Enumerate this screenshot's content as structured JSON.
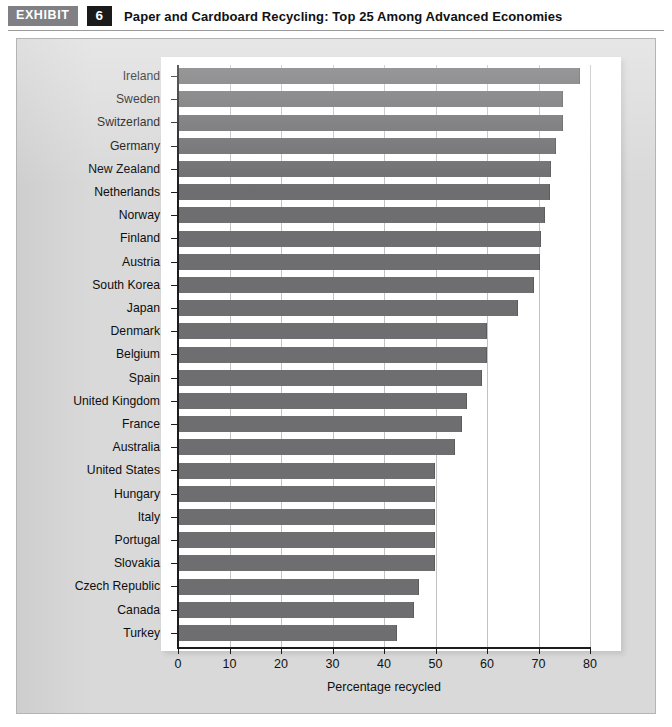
{
  "header": {
    "exhibit_tag": "EXHIBIT",
    "exhibit_number": "6",
    "title": "Paper and Cardboard Recycling: Top 25 Among Advanced Economies"
  },
  "chart_data": {
    "type": "bar",
    "orientation": "horizontal",
    "title": "Paper and Cardboard Recycling: Top 25 Among Advanced Economies",
    "xlabel": "Percentage recycled",
    "ylabel": "",
    "xlim": [
      0,
      80
    ],
    "xticks": [
      0,
      10,
      20,
      30,
      40,
      50,
      60,
      70,
      80
    ],
    "xtick_labels": [
      "0",
      "10",
      "20",
      "30",
      "40",
      "50",
      "60",
      "70",
      "80"
    ],
    "grid": "vertical",
    "legend": "none",
    "bar_color": "#6e6e70",
    "plot_background": "#ffffff",
    "panel_background": "#d9d9d9",
    "categories": [
      "Ireland",
      "Sweden",
      "Switzerland",
      "Germany",
      "New Zealand",
      "Netherlands",
      "Norway",
      "Finland",
      "Austria",
      "South Korea",
      "Japan",
      "Denmark",
      "Belgium",
      "Spain",
      "United Kingdom",
      "France",
      "Australia",
      "United States",
      "Hungary",
      "Italy",
      "Portugal",
      "Slovakia",
      "Czech Republic",
      "Canada",
      "Turkey"
    ],
    "values": [
      77.8,
      74.5,
      74.5,
      73.3,
      72.2,
      72.1,
      71.1,
      70.2,
      70.1,
      68.9,
      65.8,
      59.8,
      59.8,
      58.9,
      56.0,
      55.0,
      53.5,
      49.8,
      49.8,
      49.8,
      49.8,
      49.8,
      46.6,
      45.6,
      42.4
    ]
  }
}
